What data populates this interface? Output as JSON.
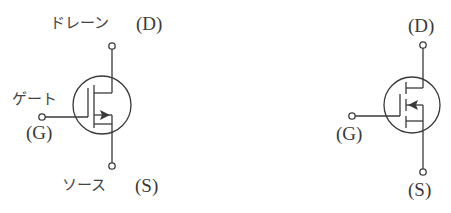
{
  "diagram": {
    "left_symbol": {
      "type": "MOSFET depletion-type (n-channel)",
      "drain_label_jp": "ドレーン",
      "drain_label": "(D)",
      "gate_label_jp": "ゲート",
      "gate_label": "(G)",
      "source_label_jp": "ソース",
      "source_label": "(S)"
    },
    "right_symbol": {
      "type": "MOSFET enhancement-type (p-channel)",
      "drain_label": "(D)",
      "gate_label": "(G)",
      "source_label": "(S)"
    },
    "colors": {
      "stroke": "#3a3a3a",
      "background": "#ffffff"
    }
  }
}
